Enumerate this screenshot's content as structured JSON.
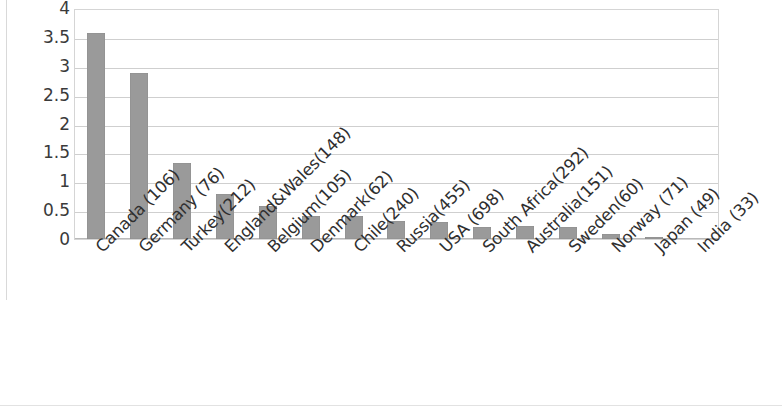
{
  "chart_data": {
    "type": "bar",
    "title": "",
    "subtitle": "",
    "xlabel": "",
    "ylabel": "",
    "ylim": [
      0,
      4
    ],
    "grid": true,
    "legend": null,
    "bar_color": "#9a9a9a",
    "gridline_color": "#cfcfcf",
    "axis_color": "#b9b9b9",
    "y_ticks": [
      "0",
      "0.5",
      "1",
      "1.5",
      "2",
      "2.5",
      "3",
      "3.5",
      "4"
    ],
    "y_tick_values": [
      0,
      0.5,
      1,
      1.5,
      2,
      2.5,
      3,
      3.5,
      4
    ],
    "categories": [
      "Canada (106)",
      "Germany (76)",
      "Turkey(212)",
      "England&Wales(148)",
      "Belgium(105)",
      "Denmark(62)",
      "Chile(240)",
      "Russia(455)",
      "USA (698)",
      "South Africa(292)",
      "Australia(151)",
      "Sweden(60)",
      "Norway (71)",
      "Japan (49)",
      "India (33)"
    ],
    "values": [
      3.57,
      2.87,
      1.32,
      0.78,
      0.58,
      0.4,
      0.4,
      0.31,
      0.3,
      0.21,
      0.22,
      0.2,
      0.09,
      0.03,
      0.0
    ]
  }
}
